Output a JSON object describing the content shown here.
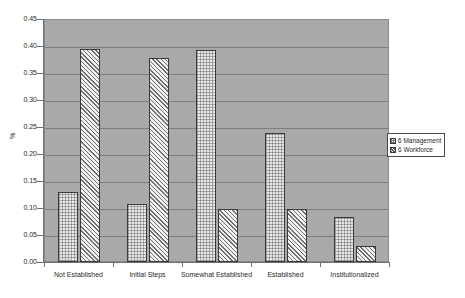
{
  "chart_data": {
    "type": "bar",
    "title": "",
    "xlabel": "",
    "ylabel": "%",
    "ylim": [
      0,
      0.45
    ],
    "ytick_labels": [
      "0.45",
      "0.40",
      "0.35",
      "0.30",
      "0.25",
      "0.20",
      "0.15",
      "0.10",
      "0.05",
      "0.00"
    ],
    "ytick_values": [
      0.45,
      0.4,
      0.35,
      0.3,
      0.25,
      0.2,
      0.15,
      0.1,
      0.05,
      0.0
    ],
    "grid": true,
    "legend_position": "right",
    "categories": [
      "Not Established",
      "Initial Steps",
      "Somewhat Established",
      "Established",
      "Institutionalized"
    ],
    "series": [
      {
        "name": "6 Management",
        "values": [
          0.13,
          0.108,
          0.393,
          0.238,
          0.084
        ]
      },
      {
        "name": "6 Workforce",
        "values": [
          0.395,
          0.378,
          0.098,
          0.098,
          0.03
        ]
      }
    ],
    "colors": {
      "plot_background": "#a9a9a9",
      "page_background": "#ffffff",
      "gridline": "#7d7d7d",
      "axis": "#6f6f6f",
      "bar_border": "#3a3a3a",
      "series_0_fill": "#e9e9e9",
      "series_1_fill": "#f2f2f2",
      "text": "#2b2b2b"
    }
  },
  "legend": {
    "items": [
      {
        "label": "6 Management"
      },
      {
        "label": "6 Workforce"
      }
    ]
  }
}
